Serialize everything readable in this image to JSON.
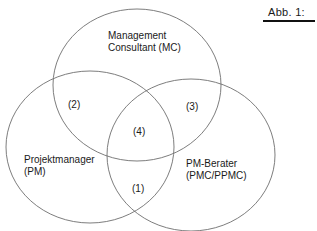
{
  "figure": {
    "caption": "Abb. 1:"
  },
  "sets": [
    {
      "id": "mc",
      "line1": "Management",
      "line2": "Consultant (MC)"
    },
    {
      "id": "pm",
      "line1": "Projektmanager",
      "line2": "(PM)"
    },
    {
      "id": "pmc",
      "line1": "PM-Berater",
      "line2": "(PMC/PPMC)"
    }
  ],
  "regions": {
    "r1": "(1)",
    "r2": "(2)",
    "r3": "(3)",
    "r4": "(4)"
  },
  "style": {
    "stroke": "#6e6e6e",
    "text": "#1a1a1a"
  }
}
